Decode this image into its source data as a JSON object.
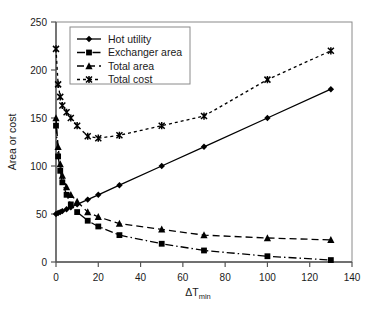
{
  "chart_data": {
    "type": "line",
    "title": "",
    "xlabel": "ΔTmin",
    "xlabel_main": "ΔT",
    "xlabel_sub": "min",
    "ylabel": "Area or cost",
    "xlim": [
      0,
      140
    ],
    "ylim": [
      0,
      250
    ],
    "xticks": [
      0,
      20,
      40,
      60,
      80,
      100,
      120,
      140
    ],
    "yticks": [
      0,
      50,
      100,
      150,
      200,
      250
    ],
    "grid": false,
    "legend_position": "top-left-inside",
    "series": [
      {
        "name": "Hot utility",
        "marker": "diamond",
        "linestyle": "solid",
        "color": "#000000",
        "x": [
          0,
          1,
          2,
          3,
          5,
          7,
          10,
          15,
          20,
          30,
          50,
          70,
          100,
          130
        ],
        "y": [
          50,
          51,
          52,
          53,
          55,
          57,
          60,
          65,
          70,
          80,
          100,
          120,
          150,
          180
        ]
      },
      {
        "name": "Exchanger area",
        "marker": "square",
        "linestyle": "dashdot",
        "color": "#000000",
        "x": [
          0,
          1,
          2,
          3,
          5,
          7,
          10,
          15,
          20,
          30,
          50,
          70,
          100,
          130
        ],
        "y": [
          142,
          110,
          95,
          83,
          70,
          60,
          52,
          43,
          37,
          28,
          19,
          12,
          6,
          2
        ]
      },
      {
        "name": "Total area",
        "marker": "triangle",
        "linestyle": "dashed",
        "color": "#000000",
        "x": [
          0,
          1,
          2,
          3,
          5,
          7,
          10,
          15,
          20,
          30,
          50,
          70,
          100,
          130
        ],
        "y": [
          150,
          120,
          102,
          90,
          78,
          70,
          63,
          52,
          47,
          40,
          34,
          28,
          25,
          23
        ]
      },
      {
        "name": "Total cost",
        "marker": "x",
        "linestyle": "dotted",
        "color": "#000000",
        "x": [
          0,
          1,
          2,
          3,
          5,
          7,
          10,
          15,
          20,
          30,
          50,
          70,
          100,
          130
        ],
        "y": [
          222,
          185,
          172,
          163,
          156,
          150,
          142,
          131,
          129,
          132,
          142,
          152,
          190,
          220
        ]
      }
    ]
  },
  "legend": {
    "items": [
      {
        "label": "Hot utility"
      },
      {
        "label": "Exchanger area"
      },
      {
        "label": "Total area"
      },
      {
        "label": "Total cost"
      }
    ]
  },
  "axes": {
    "x_tick_labels": [
      "0",
      "20",
      "40",
      "60",
      "80",
      "100",
      "120",
      "140"
    ],
    "y_tick_labels": [
      "0",
      "50",
      "100",
      "150",
      "200",
      "250"
    ],
    "y_axis_title": "Area or cost",
    "x_axis_title_main": "ΔT",
    "x_axis_title_sub": "min"
  }
}
